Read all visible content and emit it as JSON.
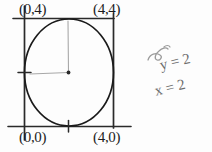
{
  "diagram": {
    "stroke_color": "#1c1c1c",
    "pencil_color": "#9a9a9a",
    "background": "#fdfdfd",
    "square": {
      "corner_labels": {
        "top_left": "(0,4)",
        "top_right": "(4,4)",
        "bottom_left": "(0,0)",
        "bottom_right": "(4,0)"
      },
      "side_length_units": 4,
      "px": {
        "left": 24,
        "top": 18,
        "right": 113,
        "bottom": 126
      }
    },
    "circle": {
      "center_units": [
        2,
        2
      ],
      "radius_units": 2,
      "px": {
        "cx": 68.5,
        "cy": 72,
        "r": 45
      }
    },
    "center_point_label": "circle-center",
    "radius_lines": [
      {
        "name": "radius-up",
        "from_units": [
          2,
          2
        ],
        "to_units": [
          2,
          4
        ]
      },
      {
        "name": "radius-left",
        "from_units": [
          2,
          2
        ],
        "to_units": [
          0,
          2
        ]
      }
    ],
    "tick_marks": [
      {
        "name": "tick-left-midpoint",
        "axis": "y",
        "value_units": 2
      },
      {
        "name": "tick-bottom-midpoint",
        "axis": "x",
        "value_units": 2
      }
    ]
  },
  "annotations": {
    "equation_y": "y = 2",
    "equation_x": "x = 2",
    "scribble": "pencil-scribble"
  }
}
